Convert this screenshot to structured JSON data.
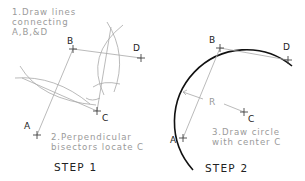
{
  "step1": {
    "title": "STEP 1",
    "note1": [
      "1.Draw lines",
      "connecting",
      "A,B,&D"
    ],
    "note2": [
      "2.Perpendicular",
      "bisectors locate C"
    ],
    "points": {
      "A": "A",
      "B": "B",
      "C": "C",
      "D": "D"
    }
  },
  "step2": {
    "title": "STEP 2",
    "note": [
      "3.Draw circle",
      "with center C"
    ],
    "radius_label": "R",
    "points": {
      "A": "A",
      "B": "B",
      "C": "C",
      "D": "D"
    }
  },
  "colors": {
    "construction": "#a8a8a8",
    "circle": "#111111",
    "label": "#222222",
    "note": "#9a9a9a"
  }
}
